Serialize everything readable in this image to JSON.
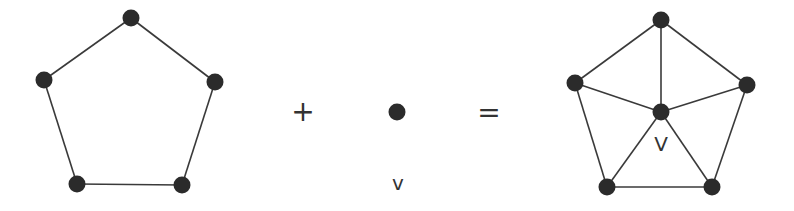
{
  "diagram": {
    "colors": {
      "node": "#2b2b2b",
      "edge": "#3a3a3a",
      "text": "#333333",
      "background": "#ffffff"
    },
    "left_graph": {
      "name": "cycle C5",
      "nodes": [
        {
          "id": "a",
          "x": 131,
          "y": 18
        },
        {
          "id": "b",
          "x": 215,
          "y": 82
        },
        {
          "id": "c",
          "x": 182,
          "y": 185
        },
        {
          "id": "d",
          "x": 77,
          "y": 184
        },
        {
          "id": "e",
          "x": 44,
          "y": 80
        }
      ],
      "edges": [
        [
          "a",
          "b"
        ],
        [
          "b",
          "c"
        ],
        [
          "c",
          "d"
        ],
        [
          "d",
          "e"
        ],
        [
          "e",
          "a"
        ]
      ]
    },
    "plus_operator": "+",
    "middle_vertex": {
      "x": 397,
      "y": 112,
      "label": "v"
    },
    "equals_operator": "=",
    "right_graph": {
      "name": "wheel W5",
      "nodes": [
        {
          "id": "a",
          "x": 661,
          "y": 20
        },
        {
          "id": "b",
          "x": 747,
          "y": 85
        },
        {
          "id": "c",
          "x": 712,
          "y": 187
        },
        {
          "id": "d",
          "x": 607,
          "y": 187
        },
        {
          "id": "e",
          "x": 575,
          "y": 83
        },
        {
          "id": "v",
          "x": 661,
          "y": 112
        }
      ],
      "edges": [
        [
          "a",
          "b"
        ],
        [
          "b",
          "c"
        ],
        [
          "c",
          "d"
        ],
        [
          "d",
          "e"
        ],
        [
          "e",
          "a"
        ],
        [
          "v",
          "a"
        ],
        [
          "v",
          "b"
        ],
        [
          "v",
          "c"
        ],
        [
          "v",
          "d"
        ],
        [
          "v",
          "e"
        ]
      ],
      "hub_label": "V"
    }
  }
}
